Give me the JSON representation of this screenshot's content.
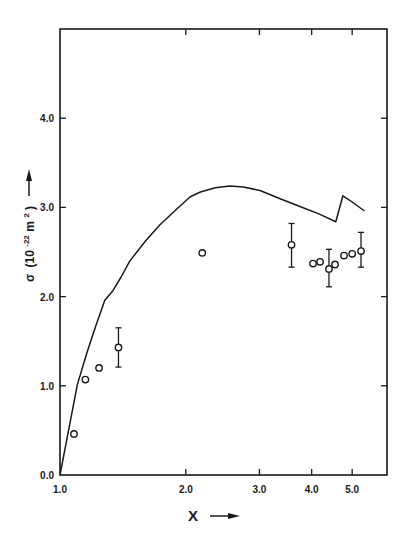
{
  "chart_data": {
    "type": "scatter",
    "title": "",
    "xlabel": "X",
    "ylabel": "σ (10⁻²² m²)",
    "ylabel_parts": {
      "symbol": "σ",
      "unit_open": "(10",
      "exp1": "-22",
      "unit_mid": " m",
      "exp2": "2",
      "unit_close": ")"
    },
    "x_scale": "log",
    "xlim": [
      1.0,
      6.0
    ],
    "ylim": [
      0.0,
      4.95
    ],
    "x_ticks": [
      1.0,
      2.0,
      3.0,
      4.0,
      5.0
    ],
    "x_tick_labels": [
      "1.0",
      "2.0",
      "3.0",
      "4.0",
      "5.0"
    ],
    "y_ticks": [
      0.0,
      1.0,
      2.0,
      3.0,
      4.0
    ],
    "y_tick_labels": [
      "0.0",
      "1.0",
      "2.0",
      "3.0",
      "4.0"
    ],
    "grid": false,
    "legend": null,
    "series": [
      {
        "name": "theory",
        "type": "line",
        "x": [
          1.0,
          1.05,
          1.1,
          1.16,
          1.22,
          1.28,
          1.34,
          1.4,
          1.47,
          1.6,
          1.73,
          1.9,
          2.05,
          2.16,
          2.35,
          2.55,
          2.75,
          3.01,
          3.35,
          3.75,
          4.15,
          4.57,
          4.75,
          5.0,
          5.35
        ],
        "y": [
          0.0,
          0.52,
          1.01,
          1.37,
          1.68,
          1.96,
          2.07,
          2.22,
          2.4,
          2.62,
          2.8,
          2.98,
          3.12,
          3.17,
          3.22,
          3.24,
          3.23,
          3.19,
          3.1,
          3.01,
          2.93,
          2.84,
          3.13,
          3.06,
          2.96
        ]
      },
      {
        "name": "experiment",
        "type": "scatter",
        "marker": "open-circle",
        "x": [
          1.08,
          1.15,
          1.24,
          1.38,
          2.19,
          3.58,
          4.03,
          4.19,
          4.4,
          4.55,
          4.78,
          5.0,
          5.25
        ],
        "y": [
          0.46,
          1.07,
          1.2,
          1.43,
          2.49,
          2.58,
          2.37,
          2.39,
          2.31,
          2.36,
          2.46,
          2.48,
          2.51
        ],
        "error_low": [
          null,
          null,
          null,
          1.21,
          null,
          2.33,
          null,
          null,
          2.11,
          null,
          null,
          null,
          2.33
        ],
        "error_high": [
          null,
          null,
          null,
          1.65,
          null,
          2.82,
          null,
          null,
          2.53,
          null,
          null,
          null,
          2.72
        ]
      }
    ],
    "annotations": [
      "arrow pointing up next to y-axis label",
      "arrow pointing right next to x-axis label"
    ]
  },
  "colors": {
    "ink": "#1a1a1a",
    "background": "#ffffff"
  }
}
